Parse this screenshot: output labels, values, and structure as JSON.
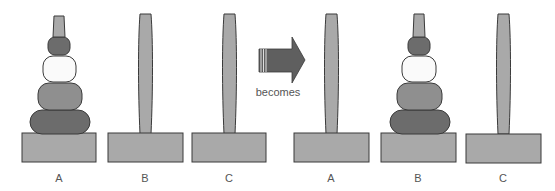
{
  "diagram": {
    "colors": {
      "outline": "#3a3a3a",
      "peg": "#a9a9a9",
      "base": "#a9a9a9",
      "disk_dark": "#6c6c6c",
      "disk_medium": "#8f8f8f",
      "disk_white": "#fafafa",
      "disk_top": "#6c6c6c",
      "peg_tip": "#a9a9a9",
      "arrow": "#5f5f5f",
      "text": "#555555"
    },
    "before": {
      "pegs": [
        {
          "label": "A",
          "disks": [
            "top-small",
            "white",
            "medium",
            "large"
          ]
        },
        {
          "label": "B",
          "disks": []
        },
        {
          "label": "C",
          "disks": []
        }
      ]
    },
    "arrow": {
      "label": "becomes"
    },
    "after": {
      "pegs": [
        {
          "label": "A",
          "disks": []
        },
        {
          "label": "B",
          "disks": [
            "top-small",
            "white",
            "medium",
            "large"
          ]
        },
        {
          "label": "C",
          "disks": []
        }
      ]
    }
  }
}
